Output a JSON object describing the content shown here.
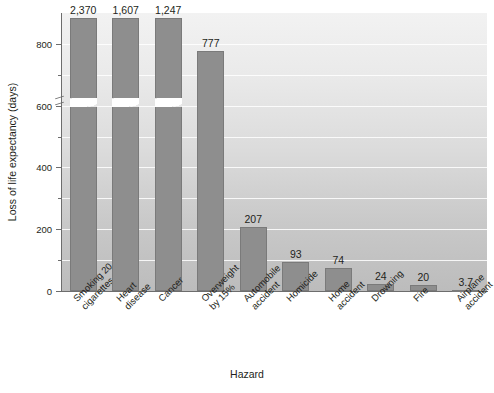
{
  "chart_data": {
    "type": "bar",
    "title": "",
    "xlabel": "Hazard",
    "ylabel": "Loss of life expectancy (days)",
    "categories": [
      "Smoking 20\ncigarettes a day",
      "Heart\ndisease",
      "Cancer",
      "Overweight\nby 15%",
      "Automobile\naccident",
      "Homicide",
      "Home\naccident",
      "Drowning",
      "Fire",
      "Airplane\naccident"
    ],
    "category_lines": [
      [
        "Smoking 20",
        "cigarettes a day"
      ],
      [
        "Heart",
        "disease"
      ],
      [
        "Cancer",
        ""
      ],
      [
        "Overweight",
        "by 15%"
      ],
      [
        "Automobile",
        "accident"
      ],
      [
        "Homicide",
        ""
      ],
      [
        "Home",
        "accident"
      ],
      [
        "Drowning",
        ""
      ],
      [
        "Fire",
        ""
      ],
      [
        "Airplane",
        "accident"
      ]
    ],
    "values": [
      2370,
      1607,
      1247,
      777,
      207,
      93,
      74,
      24,
      20,
      3.7
    ],
    "value_labels": [
      "2,370",
      "1,607",
      "1,247",
      "777",
      "207",
      "93",
      "74",
      "24",
      "20",
      "3.7"
    ],
    "ylim": [
      0,
      900
    ],
    "yticks": [
      0,
      200,
      400,
      600,
      800
    ],
    "ytick_labels": [
      "0",
      "200",
      "400",
      "600",
      "800"
    ],
    "yticks_minor": [
      100,
      300,
      500,
      700
    ],
    "gridlines": [
      100,
      200,
      300,
      400,
      500,
      600,
      700,
      800
    ],
    "grid": true,
    "axis_break": true,
    "axis_break_note": "y-axis broken just above 800; bars for 2,370 / 1,607 / 1,247 are truncated with a wavy break",
    "broken_bars": [
      0,
      1,
      2
    ],
    "legend": "none",
    "colors": {
      "bar_fill": "#8e8e8e",
      "bar_edge": "#7a7a7a",
      "plot_background_top": "#f2f2f2",
      "plot_background_bottom": "#bcbcbc",
      "gridline": "#ffffff",
      "axis": "#6d6d6d",
      "text": "#231f20"
    }
  }
}
